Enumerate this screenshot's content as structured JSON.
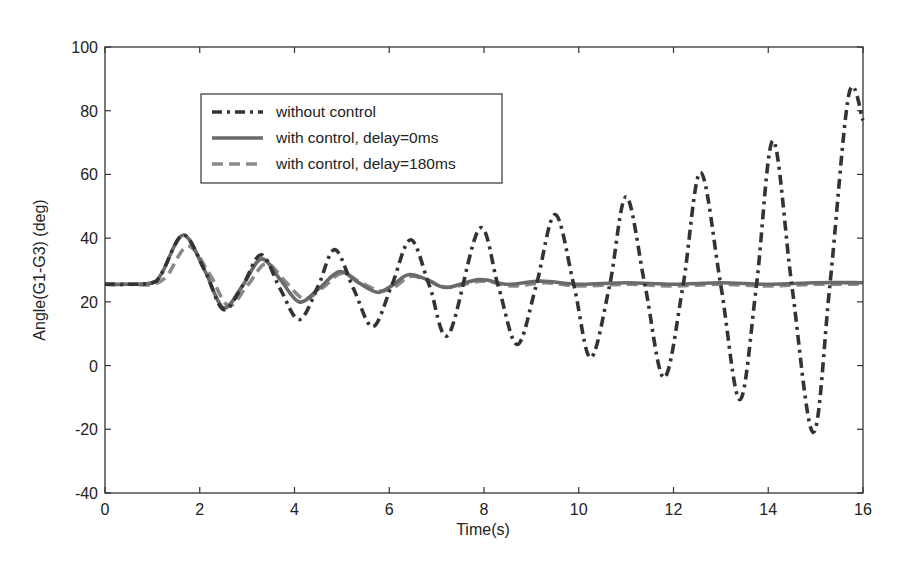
{
  "chart_data": {
    "type": "line",
    "title": "",
    "xlabel": "Time(s)",
    "ylabel": "Angle(G1-G3) (deg)",
    "xlim": [
      0,
      16
    ],
    "ylim": [
      -40,
      100
    ],
    "xticks": [
      0,
      2,
      4,
      6,
      8,
      10,
      12,
      14,
      16
    ],
    "yticks": [
      -40,
      -20,
      0,
      20,
      40,
      60,
      80,
      100
    ],
    "xtick_labels": [
      "0",
      "2",
      "4",
      "6",
      "8",
      "10",
      "12",
      "14",
      "16"
    ],
    "ytick_labels": [
      "-40",
      "-20",
      "0",
      "20",
      "40",
      "60",
      "80",
      "100"
    ],
    "grid": false,
    "legend_position": "upper left (inside)",
    "series": [
      {
        "name": "without control",
        "style": "dash-dot",
        "color": "#333333",
        "x": [
          0,
          0.5,
          1.0,
          1.2,
          1.65,
          2.1,
          2.5,
          2.9,
          3.3,
          3.7,
          4.1,
          4.5,
          4.85,
          5.25,
          5.65,
          6.05,
          6.45,
          6.85,
          7.25,
          7.9,
          8.3,
          8.7,
          9.1,
          9.5,
          9.9,
          10.25,
          10.65,
          11.0,
          11.4,
          11.8,
          12.2,
          12.57,
          13.0,
          13.4,
          13.75,
          14.1,
          14.5,
          14.95,
          15.3,
          15.7,
          16.0
        ],
        "y": [
          25.5,
          25.5,
          26,
          29,
          41,
          30,
          17.6,
          25,
          34.8,
          24,
          14.4,
          25,
          36.4,
          24,
          12.2,
          25,
          39.5,
          25,
          9.7,
          43,
          25,
          6.6,
          25,
          47.4,
          25,
          2.5,
          25,
          53,
          25,
          -3.8,
          25,
          60.6,
          25,
          -10.7,
          25,
          70.6,
          25,
          -21,
          25,
          85,
          77
        ]
      },
      {
        "name": "with control, delay=0ms",
        "style": "solid",
        "color": "#6a6a6a",
        "x": [
          0,
          0.5,
          1.0,
          1.2,
          1.65,
          2.1,
          2.5,
          2.9,
          3.3,
          3.7,
          4.1,
          4.5,
          4.95,
          5.35,
          5.75,
          6.05,
          6.4,
          6.8,
          7.2,
          7.9,
          8.5,
          9.2,
          10.0,
          11.0,
          12.0,
          13.0,
          14.0,
          15.0,
          16.0
        ],
        "y": [
          25.5,
          25.5,
          26,
          29,
          41,
          30,
          18.2,
          25,
          33.5,
          27,
          20,
          24,
          29.5,
          26,
          23,
          25,
          28.5,
          27,
          24.5,
          27,
          25.5,
          26.5,
          25.5,
          26,
          25.5,
          26,
          25.5,
          26,
          26
        ]
      },
      {
        "name": "with control, delay=180ms",
        "style": "dashed",
        "color": "#8a8a8a",
        "x": [
          0,
          0.5,
          1.0,
          1.3,
          1.75,
          2.2,
          2.6,
          3.0,
          3.4,
          3.8,
          4.2,
          4.6,
          5.0,
          5.4,
          5.8,
          6.1,
          6.45,
          6.85,
          7.25,
          7.95,
          8.6,
          9.3,
          10.0,
          11.0,
          12.0,
          13.0,
          14.0,
          15.0,
          16.0
        ],
        "y": [
          25.5,
          25.5,
          25.5,
          28,
          37.5,
          29,
          18.8,
          25,
          32,
          26.5,
          21,
          24.5,
          29,
          26,
          23.5,
          24.5,
          28,
          26.5,
          24.5,
          26.5,
          25,
          26,
          25,
          25.5,
          25,
          25.5,
          25,
          25.5,
          25.5
        ]
      }
    ]
  },
  "legend": {
    "items": [
      {
        "label": "without control"
      },
      {
        "label": "with control, delay=0ms"
      },
      {
        "label": "with control, delay=180ms"
      }
    ]
  },
  "axes": {
    "xlabel": "Time(s)",
    "ylabel": "Angle(G1-G3) (deg)"
  }
}
